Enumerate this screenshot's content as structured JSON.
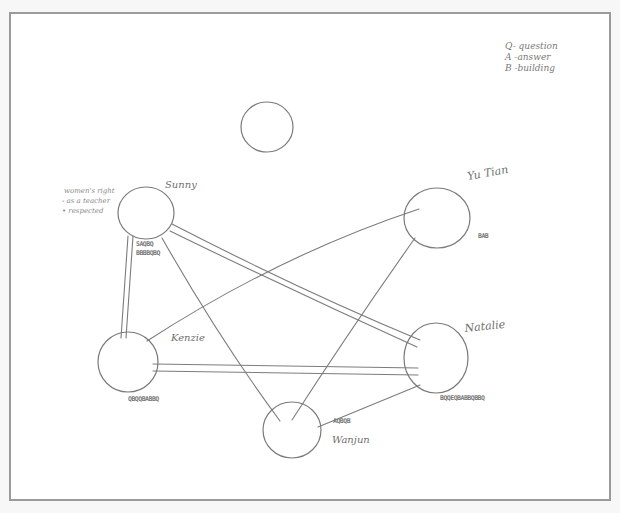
{
  "legend": {
    "items": [
      {
        "key": "Q",
        "text": "Q- question"
      },
      {
        "key": "A",
        "text": "A -answer"
      },
      {
        "key": "B",
        "text": "B -building"
      }
    ]
  },
  "nodes": {
    "unnamed": {
      "label": ""
    },
    "sunny": {
      "label": "Sunny",
      "codes_line1": "SAQBQ",
      "codes_line2": "BBBBQBQ",
      "notes": [
        "women's right",
        "- as a teacher",
        "• respected"
      ]
    },
    "yu_tian": {
      "label": "Yu Tian",
      "codes": "BAB"
    },
    "kenzie": {
      "label": "Kenzie",
      "codes": "QBQQBABBQ"
    },
    "natalie": {
      "label": "Natalie",
      "codes": "BQQEQBABBQBBQ"
    },
    "wanjun": {
      "label": "Wanjun",
      "codes": "AQBQB"
    }
  },
  "edges": [
    {
      "from": "Sunny",
      "to": "Kenzie",
      "style": "double"
    },
    {
      "from": "Sunny",
      "to": "Natalie",
      "style": "double"
    },
    {
      "from": "Sunny",
      "to": "Wanjun",
      "style": "single"
    },
    {
      "from": "Kenzie",
      "to": "Yu Tian",
      "style": "single"
    },
    {
      "from": "Kenzie",
      "to": "Natalie",
      "style": "double"
    },
    {
      "from": "Yu Tian",
      "to": "Wanjun",
      "style": "single"
    },
    {
      "from": "Wanjun",
      "to": "Natalie",
      "style": "single"
    }
  ],
  "colors": {
    "stroke": "#7a7a7a",
    "text": "#6f6f6f",
    "frame": "#9a9a9a"
  }
}
